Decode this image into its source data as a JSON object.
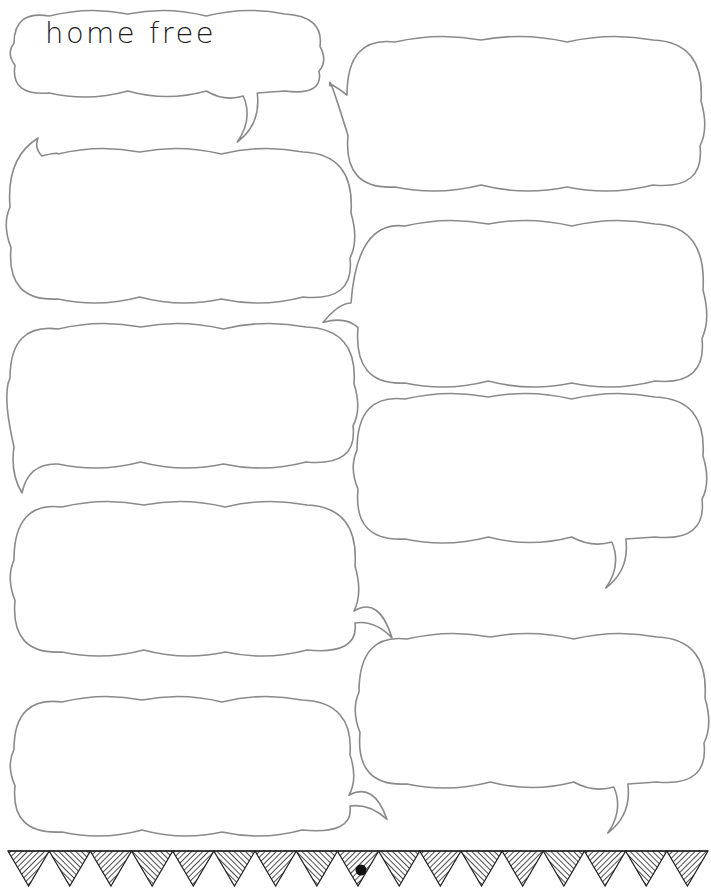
{
  "worksheet": {
    "title": "home free",
    "stroke_color": "#8a8a8a",
    "text_color": "#1a1a1a",
    "bubbles": [
      {
        "id": "title-bubble",
        "x": 12,
        "y": 12,
        "w": 310,
        "h": 82,
        "tail": "bottom-right",
        "text": "home free"
      },
      {
        "id": "bubble-right-1",
        "x": 345,
        "y": 38,
        "w": 358,
        "h": 150,
        "tail": "left-top",
        "text": ""
      },
      {
        "id": "bubble-left-1",
        "x": 8,
        "y": 150,
        "w": 345,
        "h": 150,
        "tail": "top-left",
        "text": ""
      },
      {
        "id": "bubble-right-2",
        "x": 355,
        "y": 222,
        "w": 350,
        "h": 162,
        "tail": "left-bottom",
        "text": ""
      },
      {
        "id": "bubble-left-2",
        "x": 8,
        "y": 325,
        "w": 348,
        "h": 140,
        "tail": "bottom-left",
        "text": ""
      },
      {
        "id": "bubble-right-3",
        "x": 355,
        "y": 395,
        "w": 350,
        "h": 145,
        "tail": "bottom-right",
        "text": ""
      },
      {
        "id": "bubble-left-3",
        "x": 12,
        "y": 503,
        "w": 345,
        "h": 150,
        "tail": "right",
        "text": ""
      },
      {
        "id": "bubble-right-4",
        "x": 357,
        "y": 635,
        "w": 350,
        "h": 150,
        "tail": "bottom-right",
        "text": ""
      },
      {
        "id": "bubble-left-4",
        "x": 12,
        "y": 698,
        "w": 340,
        "h": 135,
        "tail": "right",
        "text": ""
      }
    ],
    "bunting": {
      "triangles": 17,
      "center_dot": true
    }
  }
}
